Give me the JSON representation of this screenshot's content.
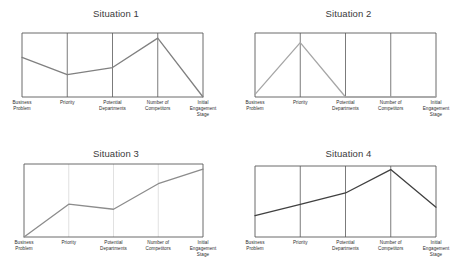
{
  "figure": {
    "background": "#ffffff",
    "frame_color": "#595959",
    "gridline_color": "#595959",
    "gridline_color_light": "#d9d9d9",
    "title_color": "#3b3b3b",
    "label_color": "#2e2e2e"
  },
  "chart_data": [
    {
      "type": "line",
      "title": "Situation 1",
      "xlabel": "",
      "ylabel": "",
      "categories": [
        "Business\nProblem",
        "Priority",
        "Potential\nDepartments",
        "Number of\nCompetitors",
        "Initial\nEngagement\nStage"
      ],
      "values": [
        0.62,
        0.35,
        0.46,
        0.92,
        0.0
      ],
      "ylim": [
        0,
        1
      ],
      "grid": true,
      "grid_style": "vertical-dark",
      "legend": "none",
      "line_color": "#808080"
    },
    {
      "type": "line",
      "title": "Situation 2",
      "xlabel": "",
      "ylabel": "",
      "categories": [
        "Business\nProblem",
        "Priority",
        "Potential\nDepartments",
        "Number of\nCompetitors",
        "Initial\nEngagement\nStage"
      ],
      "values": [
        0.04,
        0.85,
        0.0,
        0.0,
        0.0
      ],
      "ylim": [
        0,
        1
      ],
      "grid": true,
      "grid_style": "vertical-dark",
      "legend": "none",
      "line_color": "#a6a6a6"
    },
    {
      "type": "line",
      "title": "Situation 3",
      "xlabel": "",
      "ylabel": "",
      "categories": [
        "Business\nProblem",
        "Priority",
        "Potential\nDepartments",
        "Number of\nCompetitors",
        "Initial\nEngagement\nStage"
      ],
      "values": [
        0.0,
        0.45,
        0.38,
        0.73,
        0.93
      ],
      "ylim": [
        0,
        1
      ],
      "grid": true,
      "grid_style": "vertical-light",
      "legend": "none",
      "line_color": "#8c8c8c"
    },
    {
      "type": "line",
      "title": "Situation 4",
      "xlabel": "",
      "ylabel": "",
      "categories": [
        "Business\nProblem",
        "Priority",
        "Potential\nDepartments",
        "Number of\nCompetitors",
        "Initial\nEngagement\nStage"
      ],
      "values": [
        0.3,
        0.46,
        0.62,
        0.95,
        0.42
      ],
      "ylim": [
        0,
        1
      ],
      "grid": true,
      "grid_style": "vertical-dark",
      "legend": "none",
      "line_color": "#404040"
    }
  ]
}
